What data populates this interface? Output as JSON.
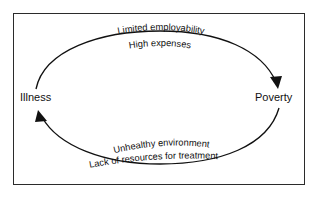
{
  "diagram": {
    "type": "cycle",
    "title": "",
    "background_color": "#ffffff",
    "border_color": "#2b2b2b",
    "line_color": "#111111",
    "nodes": [
      {
        "id": "illness",
        "label": "Illness",
        "position": "left"
      },
      {
        "id": "poverty",
        "label": "Poverty",
        "position": "right"
      }
    ],
    "edges": [
      {
        "id": "illness-to-poverty",
        "from": "illness",
        "to": "poverty",
        "direction": "clockwise-top",
        "labels": [
          "Limited employability",
          "High expenses"
        ]
      },
      {
        "id": "poverty-to-illness",
        "from": "poverty",
        "to": "illness",
        "direction": "clockwise-bottom",
        "labels": [
          "Unhealthy environment",
          "Lack of resources for treatment"
        ]
      }
    ],
    "labels": {
      "top_line_1": "Limited employability",
      "top_line_2": "High expenses",
      "bottom_line_1": "Unhealthy environment",
      "bottom_line_2": "Lack of resources for treatment"
    }
  }
}
